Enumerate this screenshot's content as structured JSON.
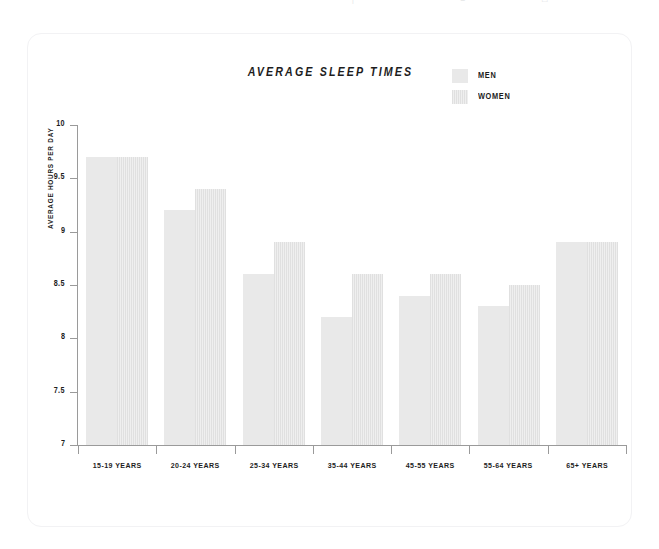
{
  "clipped_header_fragments": [
    "|",
    "≡",
    "□"
  ],
  "chart_data": {
    "type": "bar",
    "title": "AVERAGE SLEEP TIMES",
    "xlabel": "",
    "ylabel": "AVERAGE HOURS PER DAY",
    "ylim": [
      7,
      10
    ],
    "yticks": [
      "7",
      "7.5",
      "8",
      "8.5",
      "9",
      "9.5",
      "10"
    ],
    "ytick_values": [
      7,
      7.5,
      8,
      8.5,
      9,
      9.5,
      10
    ],
    "grid": false,
    "legend_position": "top-right",
    "categories": [
      "15-19 YEARS",
      "20-24 YEARS",
      "25-34 YEARS",
      "35-44 YEARS",
      "45-55 YEARS",
      "55-64 YEARS",
      "65+ YEARS"
    ],
    "series": [
      {
        "name": "MEN",
        "color": "#e9e9e9",
        "values": [
          9.7,
          9.2,
          8.6,
          8.2,
          8.4,
          8.3,
          8.9
        ]
      },
      {
        "name": "WOMEN",
        "color": "#e3e3e3",
        "values": [
          9.7,
          9.4,
          8.9,
          8.6,
          8.6,
          8.5,
          8.9
        ]
      }
    ]
  }
}
